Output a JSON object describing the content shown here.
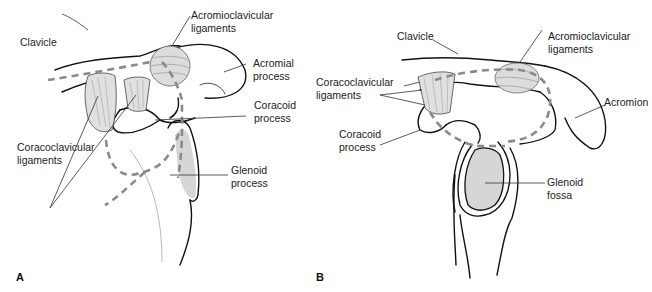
{
  "figure": {
    "panels": [
      {
        "id": "A",
        "letter": "A",
        "labels": {
          "clavicle": "Clavicle",
          "acromioclavicular_1": "Acromioclavicular",
          "acromioclavicular_2": "ligaments",
          "acromial_1": "Acromial",
          "acromial_2": "process",
          "coracoid_1": "Coracoid",
          "coracoid_2": "process",
          "coracoclavicular_1": "Coracoclavicular",
          "coracoclavicular_2": "ligaments",
          "glenoid_1": "Glenoid",
          "glenoid_2": "process"
        }
      },
      {
        "id": "B",
        "letter": "B",
        "labels": {
          "clavicle": "Clavicle",
          "acromioclavicular_1": "Acromioclavicular",
          "acromioclavicular_2": "ligaments",
          "coracoclavicular_1": "Coracoclavicular",
          "coracoclavicular_2": "ligaments",
          "acromion": "Acromion",
          "coracoid_1": "Coracoid",
          "coracoid_2": "process",
          "glenoid_1": "Glenoid",
          "glenoid_2": "fossa"
        }
      }
    ],
    "colors": {
      "outline": "#111111",
      "dashed": "#8a8a8a",
      "fill_gray": "#d9d9d9",
      "ligament": "#e3e3e3",
      "leader": "#333333"
    }
  }
}
